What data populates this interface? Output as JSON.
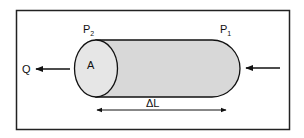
{
  "diagram": {
    "labels": {
      "p2": "P",
      "p2_sub": "2",
      "p1": "P",
      "p1_sub": "1",
      "area": "A",
      "flow": "Q",
      "length": "ΔL"
    },
    "colors": {
      "frame": "#222222",
      "cylinder_fill": "#d8d8d8",
      "end_fill": "#e6e6e6",
      "stroke": "#111111"
    }
  }
}
